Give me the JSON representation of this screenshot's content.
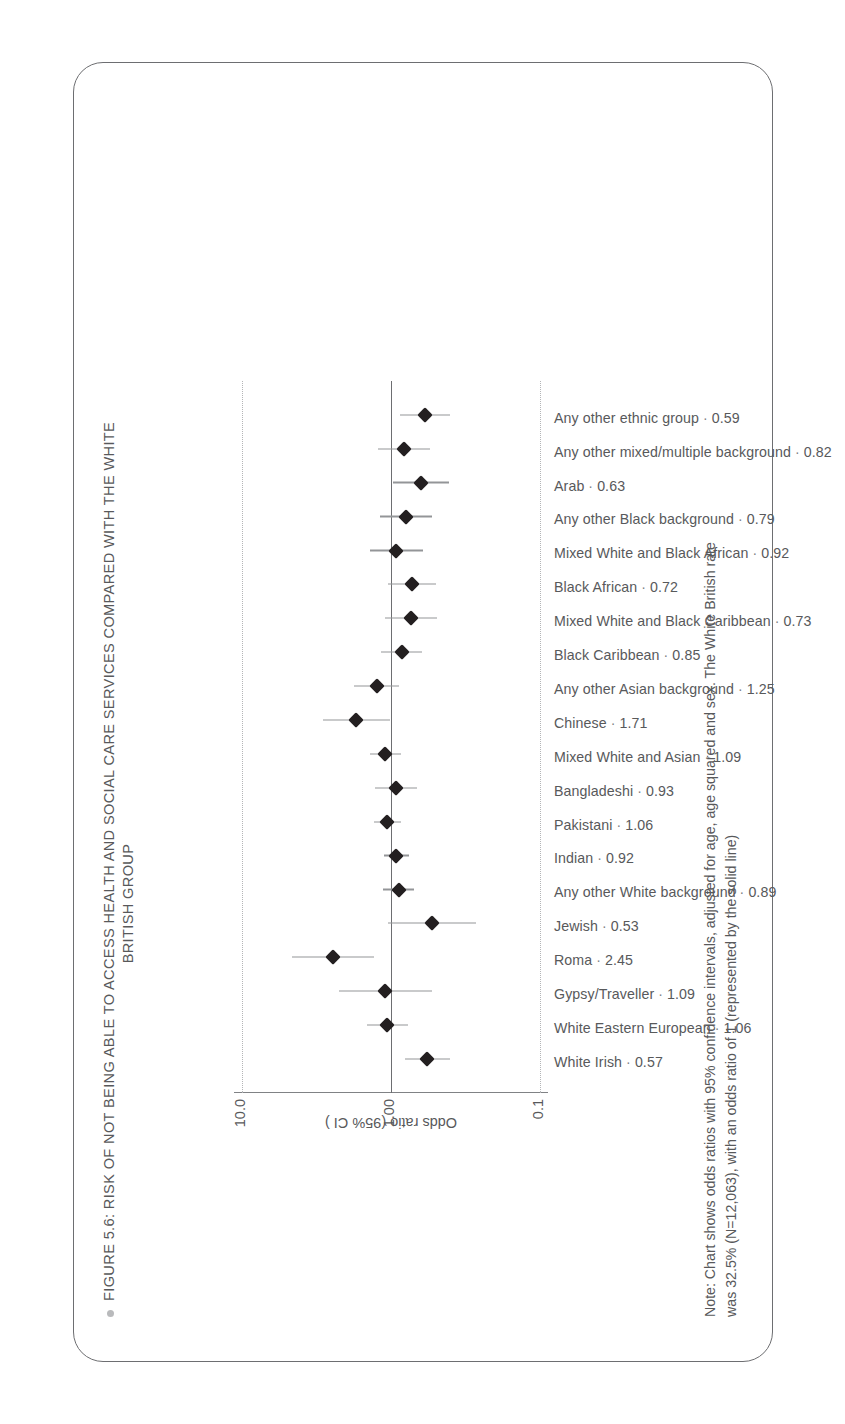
{
  "figure": {
    "title_line1": "FIGURE 5.6: RISK OF NOT BEING ABLE TO ACCESS HEALTH AND SOCIAL CARE SERVICES COMPARED WITH THE WHITE",
    "title_line2": "BRITISH GROUP",
    "note_line1": "Note: Chart shows odds ratios with 95% confidence intervals, adjusted for age, age squared and sex. The White British rate",
    "note_line2": "was 32.5% (N=12,063), with an odds ratio of 1 (represented by the solid line)",
    "bullet_color": "#b9babc",
    "border_color": "#6d6e71",
    "marker_color": "#231f20",
    "whisker_color": "#939598",
    "grid_color": "#b4b5b7",
    "refline_color": "#6d6e71"
  },
  "chart_data": {
    "type": "scatter",
    "title": "FIGURE 5.6: RISK OF NOT BEING ABLE TO ACCESS HEALTH AND SOCIAL CARE SERVICES COMPARED WITH THE WHITE BRITISH GROUP",
    "xlabel": "",
    "ylabel": "Odds ratio (95% CI )",
    "yscale": "log",
    "ylim": [
      0.1,
      10.0
    ],
    "yticks": [
      0.1,
      1.0,
      10.0
    ],
    "ytick_labels": [
      "0.1",
      "1.00",
      "10.0"
    ],
    "reference_line": 1.0,
    "grid": "dotted at 0.1 and 10.0",
    "legend": "none",
    "categories": [
      "White Irish",
      "White Eastern European",
      "Gypsy/Traveller",
      "Roma",
      "Jewish",
      "Any other White background",
      "Indian",
      "Pakistani",
      "Bangladeshi",
      "Mixed White and Asian",
      "Chinese",
      "Any other Asian background",
      "Black Caribbean",
      "Mixed White and Black Caribbean",
      "Black African",
      "Mixed White and Black African",
      "Any other Black background",
      "Arab",
      "Any other mixed/multiple background",
      "Any other ethnic group"
    ],
    "values": [
      0.57,
      1.06,
      1.09,
      2.45,
      0.53,
      0.89,
      0.92,
      1.06,
      0.93,
      1.09,
      1.71,
      1.25,
      0.85,
      0.73,
      0.72,
      0.92,
      0.79,
      0.63,
      0.82,
      0.59
    ],
    "value_labels": [
      "0.57",
      "1.06",
      "1.09",
      "2.45",
      "0.53",
      "0.89",
      "0.92",
      "1.06",
      "0.93",
      "1.09",
      "1.71",
      "1.25",
      "0.85",
      "0.73",
      "0.72",
      "0.92",
      "0.79",
      "0.63",
      "0.82",
      "0.59"
    ],
    "ci_low": [
      0.4,
      0.77,
      0.53,
      1.3,
      0.27,
      0.7,
      0.76,
      0.86,
      0.67,
      0.86,
      1.02,
      0.88,
      0.62,
      0.49,
      0.5,
      0.61,
      0.53,
      0.41,
      0.55,
      0.4
    ],
    "ci_high": [
      0.81,
      1.46,
      2.24,
      4.63,
      1.04,
      1.13,
      1.11,
      1.31,
      1.29,
      1.38,
      2.87,
      1.77,
      1.16,
      1.09,
      1.04,
      1.39,
      1.18,
      0.97,
      1.22,
      0.87
    ]
  },
  "axis": {
    "tick_top": "10.0",
    "tick_mid": "1.00",
    "tick_bottom": "0.1",
    "title": "Odds ratio (95% CI )"
  }
}
